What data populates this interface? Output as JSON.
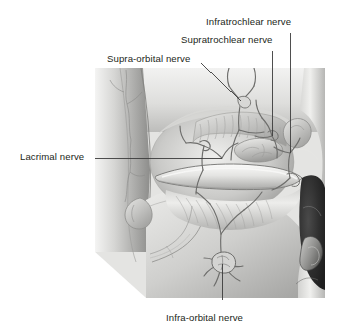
{
  "figure": {
    "type": "anatomical-illustration",
    "palette": {
      "background": "#ffffff",
      "label_text": "#231f20",
      "leader_line": "#3c3c3c",
      "tissue_light": "#e8e8e6",
      "tissue_mid": "#bdbdbb",
      "tissue_dark": "#8e8e8c",
      "bone_shadow": "#6e6e6c",
      "cavity_dark": "#2e2e2e",
      "nerve_line": "#6b6b69"
    },
    "labels": [
      {
        "id": "infratrochlear",
        "text": "Infratrochlear nerve",
        "text_x": 206,
        "text_y": 24,
        "anchor": "start",
        "leader": {
          "type": "vertical",
          "x1": 290,
          "y1": 33,
          "x2": 290,
          "y2": 153
        }
      },
      {
        "id": "supratrochlear",
        "text": "Supratrochlear nerve",
        "text_x": 181,
        "text_y": 42,
        "anchor": "start",
        "leader": {
          "type": "vertical",
          "x1": 272,
          "y1": 51,
          "x2": 272,
          "y2": 136
        }
      },
      {
        "id": "supraorbital",
        "text": "Supra-orbital nerve",
        "text_x": 107,
        "text_y": 61,
        "anchor": "start",
        "leader": {
          "type": "diagonal",
          "x1": 201,
          "y1": 63,
          "x2": 241,
          "y2": 101
        }
      },
      {
        "id": "lacrimal",
        "text": "Lacrimal nerve",
        "text_x": 20,
        "text_y": 159,
        "anchor": "start",
        "leader": {
          "type": "horizontal",
          "x1": 95,
          "y1": 158,
          "x2": 222,
          "y2": 158
        }
      },
      {
        "id": "infraorbital",
        "text": "Infra-orbital nerve",
        "text_x": 166,
        "text_y": 320,
        "anchor": "start",
        "leader": {
          "type": "vertical",
          "x1": 222,
          "y1": 300,
          "x2": 222,
          "y2": 264
        }
      }
    ],
    "illustration_bounds": {
      "x": 95,
      "y": 68,
      "width": 230,
      "height": 230
    }
  }
}
